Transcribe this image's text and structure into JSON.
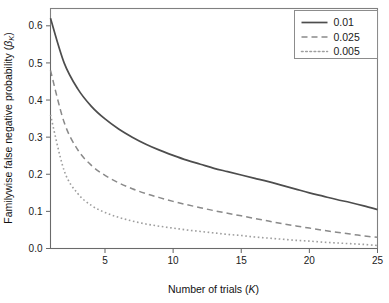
{
  "chart_data": {
    "type": "line",
    "title": "",
    "subtitle": "",
    "xlabel": "Number of trials (K)",
    "xlabel_plain": "Number of trials",
    "xlabel_symbol": "K",
    "ylabel": "Familywise false negative probability (βK)",
    "ylabel_plain": "Familywise false negative probability",
    "ylabel_symbol": "β",
    "ylabel_subscript": "K",
    "xlim": [
      1,
      25
    ],
    "ylim": [
      0.0,
      0.6466
    ],
    "xticks": [
      5,
      10,
      15,
      20,
      25
    ],
    "xtick_labels": [
      "5",
      "10",
      "15",
      "20",
      "25"
    ],
    "yticks": [
      0.0,
      0.1,
      0.2,
      0.3,
      0.4,
      0.5,
      0.6
    ],
    "ytick_labels": [
      "0.0",
      "0.1",
      "0.2",
      "0.3",
      "0.4",
      "0.5",
      "0.6"
    ],
    "grid": false,
    "legend_position": "top-right",
    "legend_framed": true,
    "x": [
      1,
      2,
      3,
      4,
      5,
      6,
      7,
      8,
      9,
      10,
      11,
      12,
      13,
      14,
      15,
      16,
      17,
      18,
      19,
      20,
      21,
      22,
      23,
      24,
      25
    ],
    "series": [
      {
        "name": "0.01",
        "label": "0.01",
        "linestyle": "solid",
        "color": "#4d4d4d",
        "width": 1.7,
        "values": [
          0.62,
          0.5,
          0.43,
          0.383,
          0.349,
          0.322,
          0.3,
          0.281,
          0.265,
          0.251,
          0.238,
          0.227,
          0.216,
          0.207,
          0.198,
          0.189,
          0.18,
          0.17,
          0.16,
          0.15,
          0.141,
          0.132,
          0.124,
          0.115,
          0.105
        ]
      },
      {
        "name": "0.025",
        "label": "0.025",
        "linestyle": "dashed",
        "color": "#8a8a8a",
        "width": 1.5,
        "values": [
          0.48,
          0.34,
          0.266,
          0.224,
          0.197,
          0.177,
          0.161,
          0.148,
          0.137,
          0.127,
          0.118,
          0.11,
          0.102,
          0.095,
          0.088,
          0.081,
          0.074,
          0.067,
          0.061,
          0.055,
          0.049,
          0.044,
          0.039,
          0.034,
          0.03
        ]
      },
      {
        "name": "0.005",
        "label": "0.005",
        "linestyle": "dotted",
        "color": "#9e9e9e",
        "width": 1.6,
        "values": [
          0.36,
          0.21,
          0.148,
          0.116,
          0.097,
          0.084,
          0.074,
          0.066,
          0.06,
          0.055,
          0.05,
          0.046,
          0.042,
          0.038,
          0.035,
          0.031,
          0.028,
          0.025,
          0.022,
          0.02,
          0.017,
          0.015,
          0.013,
          0.011,
          0.008
        ]
      }
    ],
    "annotations": []
  }
}
